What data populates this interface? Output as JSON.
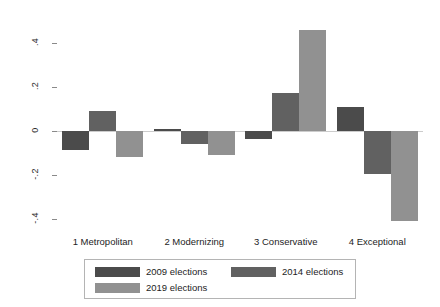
{
  "chart_data": {
    "type": "bar",
    "title": "",
    "subtitle": "",
    "xlabel": "",
    "ylabel": "",
    "categories": [
      "1 Metropolitan",
      "2 Modernizing",
      "3 Conservative",
      "4 Exceptional"
    ],
    "series": [
      {
        "name": "2009 elections",
        "color": "#4b4b4b",
        "values": [
          -0.086,
          0.01,
          -0.036,
          0.109
        ]
      },
      {
        "name": "2014 elections",
        "color": "#616161",
        "values": [
          0.091,
          -0.059,
          0.173,
          -0.195
        ]
      },
      {
        "name": "2019 elections",
        "color": "#919191",
        "values": [
          -0.118,
          -0.11,
          0.459,
          -0.41
        ]
      }
    ],
    "ylim": [
      -0.48,
      0.48
    ],
    "yticks": [
      0.4,
      0.2,
      0,
      -0.2,
      -0.4
    ],
    "ytick_labels": [
      ".4",
      ".2",
      "0",
      "-.2",
      "-.4"
    ],
    "grid": false,
    "legend_position": "bottom",
    "legend_entries": [
      "2009 elections",
      "2014 elections",
      "2019 elections"
    ]
  },
  "axes": {
    "y_tick_labels": [
      ".4",
      ".2",
      "0",
      "-.2",
      "-.4"
    ],
    "x_tick_labels": [
      "1 Metropolitan",
      "2 Modernizing",
      "3 Conservative",
      "4 Exceptional"
    ]
  },
  "legend": {
    "items": [
      {
        "label": "2009 elections",
        "color": "#4b4b4b"
      },
      {
        "label": "2014 elections",
        "color": "#616161"
      },
      {
        "label": "2019 elections",
        "color": "#919191"
      }
    ]
  },
  "colors": {
    "series_2009": "#4b4b4b",
    "series_2014": "#616161",
    "series_2019": "#919191",
    "axis": "#8a8a8a",
    "background": "#ffffff"
  }
}
